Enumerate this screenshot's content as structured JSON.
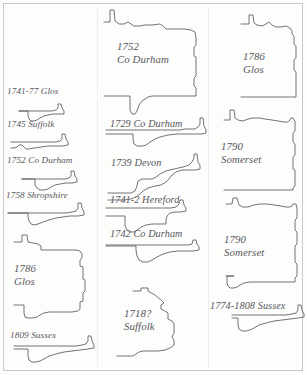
{
  "plate": {
    "type": "figure-plate",
    "description": "Scanned plate of outline profile drawings, each annotated with a date and English county",
    "background_color": "#fdfdfc",
    "line_color": "#5a5a5e",
    "text_color": "#57575c",
    "border_color": "#c9c9c9"
  },
  "columns": [
    {
      "name": "left-column",
      "profiles": [
        {
          "id": "p-1741-77-glos",
          "label_lines": [
            "1741-77 Glos"
          ],
          "size": "sm"
        },
        {
          "id": "p-1745-suffolk",
          "label_lines": [
            "1745 Suffolk"
          ],
          "size": "sm"
        },
        {
          "id": "p-1752-co-durham",
          "label_lines": [
            "1752 Co Durham"
          ],
          "size": "sm"
        },
        {
          "id": "p-1758-shropshire",
          "label_lines": [
            "1758 Shropshire"
          ],
          "size": "sm"
        },
        {
          "id": "p-1786-glos-left",
          "label_lines": [
            "1786",
            "Glos"
          ],
          "size": "lg"
        },
        {
          "id": "p-1809-sussex",
          "label_lines": [
            "1809 Sussex"
          ],
          "size": "sm"
        }
      ]
    },
    {
      "name": "middle-column",
      "profiles": [
        {
          "id": "p-1752-co-durham-large",
          "label_lines": [
            "1752",
            "Co Durham"
          ],
          "size": "lg"
        },
        {
          "id": "p-1729-co-durham",
          "label_lines": [
            "1729 Co Durham"
          ],
          "size": "md"
        },
        {
          "id": "p-1739-devon",
          "label_lines": [
            "1739 Devon"
          ],
          "size": "md"
        },
        {
          "id": "p-1741-2-hereford",
          "label_lines": [
            "1741-2 Hereford"
          ],
          "size": "md"
        },
        {
          "id": "p-1742-co-durham",
          "label_lines": [
            "1742 Co Durham"
          ],
          "size": "md"
        },
        {
          "id": "p-1718-suffolk",
          "label_lines": [
            "1718?",
            "Suffolk"
          ],
          "size": "lg"
        }
      ]
    },
    {
      "name": "right-column",
      "profiles": [
        {
          "id": "p-1786-glos-right",
          "label_lines": [
            "1786",
            "Glos"
          ],
          "size": "lg"
        },
        {
          "id": "p-1790-somerset-top",
          "label_lines": [
            "1790",
            "Somerset"
          ],
          "size": "lg"
        },
        {
          "id": "p-1790-somerset-bot",
          "label_lines": [
            "1790",
            "Somerset"
          ],
          "size": "lg"
        },
        {
          "id": "p-1774-1808-sussex",
          "label_lines": [
            "1774-1808 Sussex"
          ],
          "size": "md"
        }
      ]
    }
  ],
  "labels": {
    "l1": {
      "lines": [
        "1741-77 Glos"
      ]
    },
    "l2": {
      "lines": [
        "1745 Suffolk"
      ]
    },
    "l3": {
      "lines": [
        "1752 Co Durham"
      ]
    },
    "l4": {
      "lines": [
        "1758 Shropshire"
      ]
    },
    "l5": {
      "lines": [
        "1786",
        "Glos"
      ]
    },
    "l6": {
      "lines": [
        "1809 Sussex"
      ]
    },
    "m1": {
      "lines": [
        "1752",
        "Co Durham"
      ]
    },
    "m2": {
      "lines": [
        "1729 Co Durham"
      ]
    },
    "m3": {
      "lines": [
        "1739 Devon"
      ]
    },
    "m4": {
      "lines": [
        "1741-2 Hereford"
      ]
    },
    "m5": {
      "lines": [
        "1742 Co Durham"
      ]
    },
    "m6": {
      "lines": [
        "1718?",
        "Suffolk"
      ]
    },
    "r1": {
      "lines": [
        "1786",
        "Glos"
      ]
    },
    "r2": {
      "lines": [
        "1790",
        "Somerset"
      ]
    },
    "r3": {
      "lines": [
        "1790",
        "Somerset"
      ]
    },
    "r4": {
      "lines": [
        "1774-1808 Sussex"
      ]
    }
  }
}
